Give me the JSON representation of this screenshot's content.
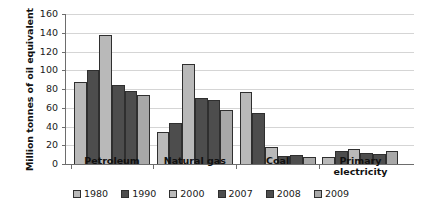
{
  "chart_data": {
    "type": "bar",
    "title": "",
    "xlabel": "",
    "ylabel": "Million tonnes of oil equivalent",
    "ylim": [
      0,
      160
    ],
    "yticks": [
      0,
      20,
      40,
      60,
      80,
      100,
      120,
      140,
      160
    ],
    "grid": true,
    "legend_position": "bottom",
    "categories": [
      "Petroleum",
      "Natural gas",
      "Coal",
      "Primary electricity"
    ],
    "category_labels_multiline": [
      [
        "Petroleum"
      ],
      [
        "Natural gas"
      ],
      [
        "Coal"
      ],
      [
        "Primary",
        "electricity"
      ]
    ],
    "series": [
      {
        "name": "1980",
        "color": "#b9b9b9",
        "values": [
          87,
          34,
          77,
          8
        ]
      },
      {
        "name": "1990",
        "color": "#4d4d4d",
        "values": [
          100,
          44,
          54,
          14
        ]
      },
      {
        "name": "2000",
        "color": "#b9b9b9",
        "values": [
          138,
          107,
          18,
          16
        ]
      },
      {
        "name": "2007",
        "color": "#4d4d4d",
        "values": [
          84,
          70,
          9,
          12
        ]
      },
      {
        "name": "2008",
        "color": "#4d4d4d",
        "values": [
          78,
          68,
          10,
          11
        ]
      },
      {
        "name": "2009",
        "color": "#a8a8a8",
        "values": [
          74,
          58,
          8,
          14
        ]
      }
    ]
  }
}
